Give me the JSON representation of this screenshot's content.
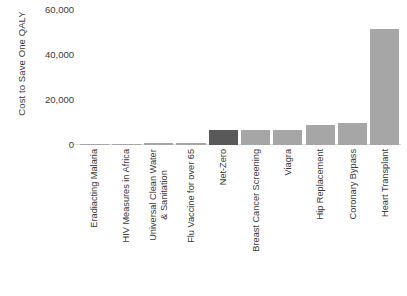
{
  "chart_data": {
    "type": "bar",
    "title": "",
    "xlabel": "",
    "ylabel": "Cost to Save One QALY",
    "ylim": [
      0,
      60000
    ],
    "ytick_values": [
      0,
      20000,
      40000,
      60000
    ],
    "ytick_labels": [
      "0",
      "20,000",
      "40,000",
      "60,000"
    ],
    "grid": false,
    "legend": false,
    "categories": [
      "Eradiacting Malaria",
      "HIV Measures in Africa",
      "Universal Clean Water & Sanitation",
      "Flu Vaccine for over 65",
      "Net-Zero",
      "Breast Cancer Screening",
      "Viagra",
      "Hip Replacement",
      "Coronary Bypass",
      "Heart Transplant"
    ],
    "values": [
      60,
      400,
      800,
      900,
      6500,
      6500,
      6500,
      9000,
      10000,
      51500
    ],
    "bar_colors": [
      "#a6a6a6",
      "#a6a6a6",
      "#a6a6a6",
      "#a6a6a6",
      "#595959",
      "#a6a6a6",
      "#a6a6a6",
      "#a6a6a6",
      "#a6a6a6",
      "#a6a6a6"
    ]
  },
  "colors": {
    "bar_default": "#a6a6a6",
    "bar_highlight": "#595959",
    "axis_line": "#d9d9d9",
    "text": "#3a3a3a",
    "background": "#ffffff"
  }
}
